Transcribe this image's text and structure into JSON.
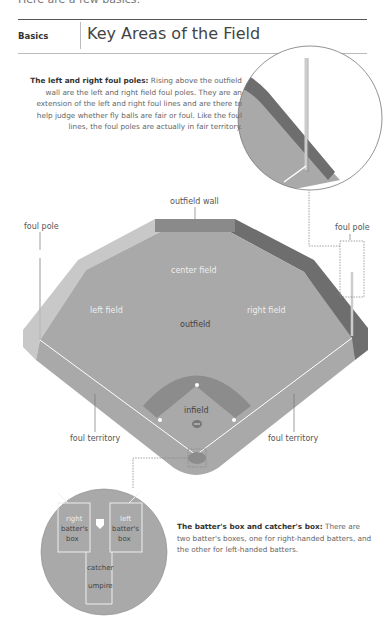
{
  "page": {
    "cut_off_text": "Here are a few basics:",
    "section_label": "Basics",
    "title": "Key Areas of the Field"
  },
  "callouts": {
    "foul_poles": {
      "heading": "The left and right foul poles:",
      "body": "Rising above the outfield wall are the left and right field foul poles. They are an extension of the left and right foul lines and are there to help judge whether fly balls are fair or foul. Like the foul lines, the foul poles are actually in fair territory."
    },
    "batters_box": {
      "heading": "The batter's box and catcher's box:",
      "body": "There are two batter's boxes, one for right-handed batters, and the other for left-handed batters."
    }
  },
  "diagram": {
    "labels": {
      "outfield_wall": "outfield wall",
      "foul_pole_left": "foul pole",
      "foul_pole_right": "foul pole",
      "center_field": "center field",
      "left_field": "left field",
      "right_field": "right field",
      "outfield": "outfield",
      "infield": "infield",
      "foul_territory_left": "foul territory",
      "foul_territory_right": "foul territory"
    },
    "detail": {
      "right_box_line1": "right",
      "right_box_line2": "batter's",
      "right_box_line3": "box",
      "left_box_line1": "left",
      "left_box_line2": "batter's",
      "left_box_line3": "box",
      "catcher": "catcher",
      "umpire": "umpire"
    },
    "colors": {
      "field": "#a9a9a9",
      "dirt": "#8c8c8c",
      "wall_center": "#8a8a8a",
      "wall_right": "#6e6e6e",
      "wall_left": "#c8c8c8",
      "lines": "#ffffff"
    }
  }
}
